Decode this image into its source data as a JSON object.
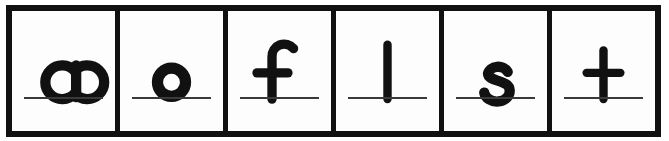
{
  "card": {
    "type": "letter-flashcard-strip",
    "description": "Row of six boxed lowercase letters with writing baselines",
    "background_color": "#ffffff",
    "frame_color": "#111111",
    "cell_background": "#fdfdfd",
    "baseline_color": "#3a3a3a",
    "letter_color": "#111111",
    "cell_count": 6,
    "word": "aoflst"
  },
  "cells": [
    {
      "index": 1,
      "letter": "a",
      "letter_case": "lowercase",
      "glyph_style": "single-story",
      "has_ascender": false,
      "has_descender": false,
      "baseline": true
    },
    {
      "index": 2,
      "letter": "o",
      "letter_case": "lowercase",
      "glyph_style": "round-bowl",
      "has_ascender": false,
      "has_descender": false,
      "baseline": true
    },
    {
      "index": 3,
      "letter": "f",
      "letter_case": "lowercase",
      "glyph_style": "hooked-ascender-with-crossbar",
      "has_ascender": true,
      "has_descender": false,
      "baseline": true
    },
    {
      "index": 4,
      "letter": "l",
      "letter_case": "lowercase",
      "glyph_style": "plain-vertical-ascender",
      "has_ascender": true,
      "has_descender": false,
      "baseline": true
    },
    {
      "index": 5,
      "letter": "s",
      "letter_case": "lowercase",
      "glyph_style": "double-curve",
      "has_ascender": false,
      "has_descender": false,
      "baseline": true
    },
    {
      "index": 6,
      "letter": "t",
      "letter_case": "lowercase",
      "glyph_style": "cross-stem-with-crossbar",
      "has_ascender": true,
      "has_descender": false,
      "baseline": true
    }
  ]
}
